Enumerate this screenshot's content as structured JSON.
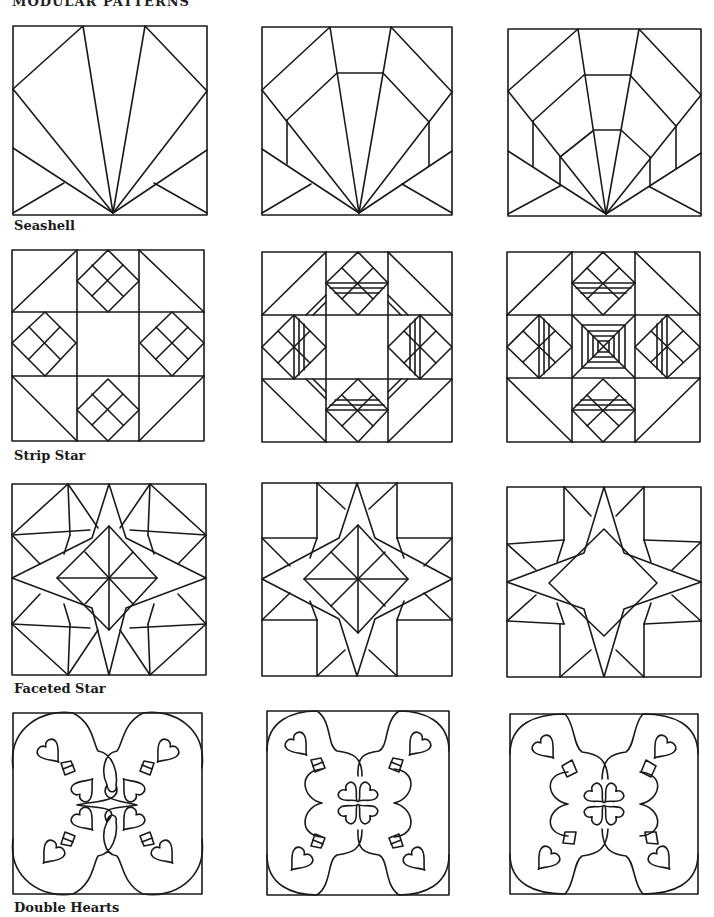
{
  "page": {
    "header_partial": "MODULAR PATTERNS",
    "background": "#ffffff",
    "ink_color": "#1a1a1a"
  },
  "rows": [
    {
      "label": "Seashell",
      "variations": [
        "seashell-1",
        "seashell-2",
        "seashell-3"
      ]
    },
    {
      "label": "Strip Star",
      "variations": [
        "strip-star-1",
        "strip-star-2",
        "strip-star-3"
      ]
    },
    {
      "label": "Faceted Star",
      "variations": [
        "faceted-star-1",
        "faceted-star-2",
        "faceted-star-3"
      ]
    },
    {
      "label": "Double Hearts",
      "variations": [
        "double-hearts-1",
        "double-hearts-2",
        "double-hearts-3"
      ]
    }
  ]
}
